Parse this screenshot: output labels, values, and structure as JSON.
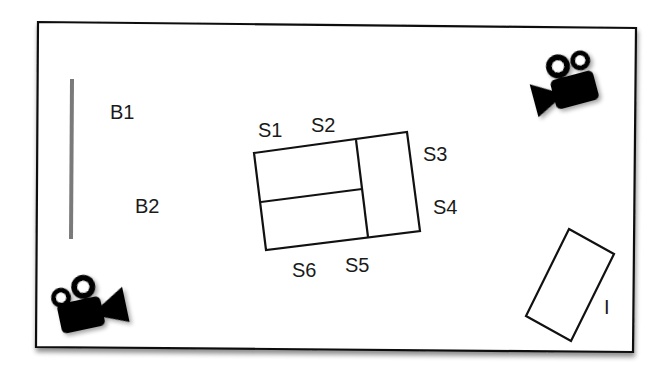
{
  "diagram": {
    "title": "",
    "labels": {
      "b1": "B1",
      "b2": "B2",
      "s1": "S1",
      "s2": "S2",
      "s3": "S3",
      "s4": "S4",
      "s5": "S5",
      "s6": "S6",
      "i": "I"
    },
    "elements": {
      "frame": "room-boundary",
      "barrier": "gray-vertical-bar",
      "central_block": "rectangle-with-three-sections",
      "object_i": "rotated-rectangle",
      "camera_top_right": "video-camera-icon",
      "camera_bottom_left": "video-camera-icon"
    },
    "colors": {
      "stroke": "#111111",
      "barrier": "#7a7a7a",
      "camera": "#000000",
      "background": "#ffffff"
    }
  }
}
